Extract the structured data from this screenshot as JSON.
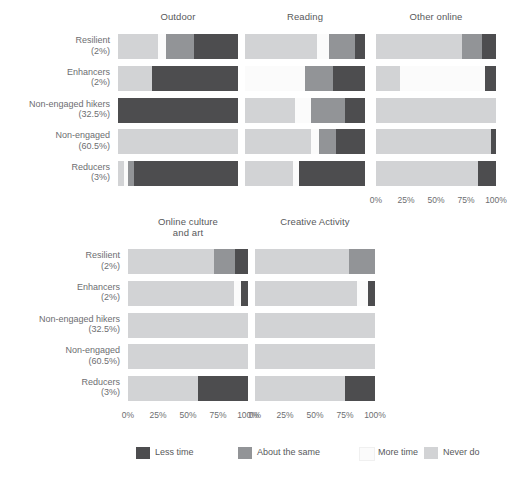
{
  "chart_data": {
    "type": "bar",
    "title": "",
    "subtitle": "",
    "xlabel": "",
    "ylabel": "",
    "xlim": [
      0,
      100
    ],
    "grid": false,
    "orientation": "horizontal",
    "stacked": true,
    "legend_position": "bottom",
    "tick_labels": [
      "0%",
      "25%",
      "50%",
      "75%",
      "100%"
    ],
    "tick_values": [
      0,
      25,
      50,
      75,
      100
    ],
    "categories": [
      "Resilient",
      "Enhancers",
      "Non-engaged hikers",
      "Non-engaged",
      "Reducers"
    ],
    "category_percentages": [
      "(2%)",
      "(2%)",
      "(32.5%)",
      "(60.5%)",
      "(3%)"
    ],
    "legend": [
      {
        "name": "Less time",
        "color": "#4d4d4f"
      },
      {
        "name": "About the same",
        "color": "#929497"
      },
      {
        "name": "More time",
        "color": "#fbfbfb"
      },
      {
        "name": "Never do",
        "color": "#d2d3d5"
      }
    ],
    "stack_order": [
      "Never do",
      "More time",
      "About the same",
      "Less time"
    ],
    "panels": [
      {
        "title": "Outdoor",
        "title_line2": "",
        "rows": [
          {
            "category": "Resilient",
            "values": {
              "Never do": 33,
              "More time": 7,
              "About the same": 23,
              "Less time": 37
            }
          },
          {
            "category": "Enhancers",
            "values": {
              "Never do": 28,
              "More time": 0,
              "About the same": 0,
              "Less time": 72
            }
          },
          {
            "category": "Non-engaged hikers",
            "values": {
              "Never do": 0,
              "More time": 0,
              "About the same": 0,
              "Less time": 100
            }
          },
          {
            "category": "Non-engaged",
            "values": {
              "Never do": 100,
              "More time": 0,
              "About the same": 0,
              "Less time": 0
            }
          },
          {
            "category": "Reducers",
            "values": {
              "Never do": 5,
              "More time": 3,
              "About the same": 5,
              "Less time": 87
            }
          }
        ]
      },
      {
        "title": "Reading",
        "title_line2": "",
        "rows": [
          {
            "category": "Resilient",
            "values": {
              "Never do": 60,
              "More time": 10,
              "About the same": 22,
              "Less time": 8
            }
          },
          {
            "category": "Enhancers",
            "values": {
              "Never do": 0,
              "More time": 50,
              "About the same": 23,
              "Less time": 27
            }
          },
          {
            "category": "Non-engaged hikers",
            "values": {
              "Never do": 42,
              "More time": 13,
              "About the same": 28,
              "Less time": 17
            }
          },
          {
            "category": "Non-engaged",
            "values": {
              "Never do": 55,
              "More time": 7,
              "About the same": 14,
              "Less time": 24
            }
          },
          {
            "category": "Reducers",
            "values": {
              "Never do": 40,
              "More time": 5,
              "About the same": 0,
              "Less time": 55
            }
          }
        ]
      },
      {
        "title": "Other online",
        "title_line2": "",
        "rows": [
          {
            "category": "Resilient",
            "values": {
              "Never do": 72,
              "More time": 0,
              "About the same": 16,
              "Less time": 12
            }
          },
          {
            "category": "Enhancers",
            "values": {
              "Never do": 20,
              "More time": 71,
              "About the same": 0,
              "Less time": 9
            }
          },
          {
            "category": "Non-engaged hikers",
            "values": {
              "Never do": 100,
              "More time": 0,
              "About the same": 0,
              "Less time": 0
            }
          },
          {
            "category": "Non-engaged",
            "values": {
              "Never do": 96,
              "More time": 0,
              "About the same": 0,
              "Less time": 4
            }
          },
          {
            "category": "Reducers",
            "values": {
              "Never do": 85,
              "More time": 0,
              "About the same": 0,
              "Less time": 15
            }
          }
        ]
      },
      {
        "title": "Online culture",
        "title_line2": "and art",
        "rows": [
          {
            "category": "Resilient",
            "values": {
              "Never do": 72,
              "More time": 0,
              "About the same": 17,
              "Less time": 11
            }
          },
          {
            "category": "Enhancers",
            "values": {
              "Never do": 88,
              "More time": 6,
              "About the same": 0,
              "Less time": 6
            }
          },
          {
            "category": "Non-engaged hikers",
            "values": {
              "Never do": 100,
              "More time": 0,
              "About the same": 0,
              "Less time": 0
            }
          },
          {
            "category": "Non-engaged",
            "values": {
              "Never do": 100,
              "More time": 0,
              "About the same": 0,
              "Less time": 0
            }
          },
          {
            "category": "Reducers",
            "values": {
              "Never do": 58,
              "More time": 0,
              "About the same": 0,
              "Less time": 42
            }
          }
        ]
      },
      {
        "title": "Creative Activity",
        "title_line2": "",
        "rows": [
          {
            "category": "Resilient",
            "values": {
              "Never do": 78,
              "More time": 0,
              "About the same": 22,
              "Less time": 0
            }
          },
          {
            "category": "Enhancers",
            "values": {
              "Never do": 85,
              "More time": 9,
              "About the same": 0,
              "Less time": 6
            }
          },
          {
            "category": "Non-engaged hikers",
            "values": {
              "Never do": 100,
              "More time": 0,
              "About the same": 0,
              "Less time": 0
            }
          },
          {
            "category": "Non-engaged",
            "values": {
              "Never do": 100,
              "More time": 0,
              "About the same": 0,
              "Less time": 0
            }
          },
          {
            "category": "Reducers",
            "values": {
              "Never do": 75,
              "More time": 0,
              "About the same": 0,
              "Less time": 25
            }
          }
        ]
      }
    ]
  }
}
